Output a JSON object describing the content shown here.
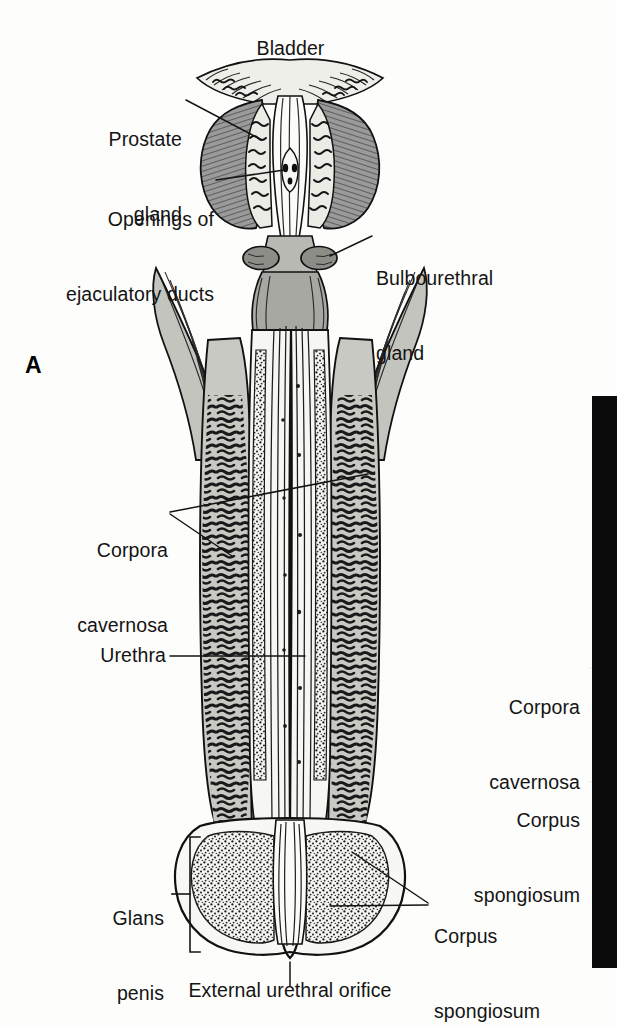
{
  "figure": {
    "panel_letter": "A",
    "background_color": "#fdfdfc",
    "ink_color": "#141414",
    "partB_color": "#0b0b0b",
    "caption_bottom": "External urethral orifice"
  },
  "labels": {
    "bladder": "Bladder",
    "prostate_gland_line1": "Prostate",
    "prostate_gland_line2": "gland",
    "openings_line1": "Openings of",
    "openings_line2": "ejaculatory ducts",
    "bulbourethral_line1": "Bulbourethral",
    "bulbourethral_line2": "gland",
    "corpora_cavernosa_left_line1": "Corpora",
    "corpora_cavernosa_left_line2": "cavernosa",
    "urethra": "Urethra",
    "glans_penis_line1": "Glans",
    "glans_penis_line2": "penis",
    "corpus_spongiosum_bottom_line1": "Corpus",
    "corpus_spongiosum_bottom_line2": "spongiosum",
    "corpora_cavernosa_right_line1": "Corpora",
    "corpora_cavernosa_right_line2": "cavernosa",
    "corpus_spongiosum_right_line1": "Corpus",
    "corpus_spongiosum_right_line2": "spongiosum",
    "external_urethral_orifice": "External urethral orifice"
  }
}
